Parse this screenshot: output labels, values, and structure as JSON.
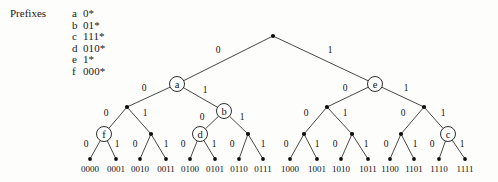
{
  "figure": {
    "type": "binary-trie-diagram",
    "legend": {
      "title": "Prefixes",
      "entries": [
        {
          "key": "a",
          "value": "0*"
        },
        {
          "key": "b",
          "value": "01*"
        },
        {
          "key": "c",
          "value": "111*"
        },
        {
          "key": "d",
          "value": "010*"
        },
        {
          "key": "e",
          "value": "1*"
        },
        {
          "key": "f",
          "value": "000*"
        }
      ]
    },
    "colors": {
      "ink": "#161616",
      "background": "#fdfdfc",
      "node_fill": "#ffffff"
    },
    "edge_labels": {
      "left": "0",
      "right": "1"
    },
    "nodes": [
      {
        "id": "root",
        "label": "",
        "x": 273,
        "y": 36,
        "kind": "dot"
      },
      {
        "id": "n0",
        "label": "a",
        "x": 177,
        "y": 84,
        "kind": "ring"
      },
      {
        "id": "n1",
        "label": "e",
        "x": 375,
        "y": 84,
        "kind": "ring"
      },
      {
        "id": "n00",
        "label": "",
        "x": 127,
        "y": 107,
        "kind": "dot"
      },
      {
        "id": "n01",
        "label": "b",
        "x": 224,
        "y": 111,
        "kind": "ring"
      },
      {
        "id": "n10",
        "label": "",
        "x": 327,
        "y": 107,
        "kind": "dot"
      },
      {
        "id": "n11",
        "label": "",
        "x": 424,
        "y": 107,
        "kind": "dot"
      },
      {
        "id": "n000",
        "label": "f",
        "x": 104,
        "y": 134,
        "kind": "ring"
      },
      {
        "id": "n001",
        "label": "",
        "x": 151,
        "y": 134,
        "kind": "dot"
      },
      {
        "id": "n010",
        "label": "d",
        "x": 200,
        "y": 134,
        "kind": "ring"
      },
      {
        "id": "n011",
        "label": "",
        "x": 248,
        "y": 134,
        "kind": "dot"
      },
      {
        "id": "n100",
        "label": "",
        "x": 304,
        "y": 134,
        "kind": "dot"
      },
      {
        "id": "n101",
        "label": "",
        "x": 352,
        "y": 134,
        "kind": "dot"
      },
      {
        "id": "n110",
        "label": "",
        "x": 401,
        "y": 134,
        "kind": "dot"
      },
      {
        "id": "n111",
        "label": "c",
        "x": 448,
        "y": 134,
        "kind": "ring"
      },
      {
        "id": "L0000",
        "label": "0000",
        "x": 90,
        "y": 159,
        "kind": "leaf"
      },
      {
        "id": "L0001",
        "label": "0001",
        "x": 116,
        "y": 159,
        "kind": "leaf"
      },
      {
        "id": "L0010",
        "label": "0010",
        "x": 140,
        "y": 159,
        "kind": "leaf"
      },
      {
        "id": "L0011",
        "label": "0011",
        "x": 166,
        "y": 159,
        "kind": "leaf"
      },
      {
        "id": "L0100",
        "label": "0100",
        "x": 190,
        "y": 159,
        "kind": "leaf"
      },
      {
        "id": "L0101",
        "label": "0101",
        "x": 215,
        "y": 159,
        "kind": "leaf"
      },
      {
        "id": "L0110",
        "label": "0110",
        "x": 239,
        "y": 159,
        "kind": "leaf"
      },
      {
        "id": "L0111",
        "label": "0111",
        "x": 263,
        "y": 159,
        "kind": "leaf"
      },
      {
        "id": "L1000",
        "label": "1000",
        "x": 290,
        "y": 159,
        "kind": "leaf"
      },
      {
        "id": "L1001",
        "label": "1001",
        "x": 317,
        "y": 159,
        "kind": "leaf"
      },
      {
        "id": "L1010",
        "label": "1010",
        "x": 341,
        "y": 159,
        "kind": "leaf"
      },
      {
        "id": "L1011",
        "label": "1011",
        "x": 368,
        "y": 159,
        "kind": "leaf"
      },
      {
        "id": "L1100",
        "label": "1100",
        "x": 390,
        "y": 159,
        "kind": "leaf"
      },
      {
        "id": "L1101",
        "label": "1101",
        "x": 414,
        "y": 159,
        "kind": "leaf"
      },
      {
        "id": "L1110",
        "label": "1110",
        "x": 439,
        "y": 159,
        "kind": "leaf"
      },
      {
        "id": "L1111",
        "label": "1111",
        "x": 465,
        "y": 159,
        "kind": "leaf"
      }
    ],
    "edges": [
      {
        "from": "root",
        "to": "n0",
        "bit": "0",
        "lx": 218,
        "ly": 53
      },
      {
        "from": "root",
        "to": "n1",
        "bit": "1",
        "lx": 330,
        "ly": 53
      },
      {
        "from": "n0",
        "to": "n00",
        "bit": "0",
        "lx": 144,
        "ly": 91
      },
      {
        "from": "n0",
        "to": "n01",
        "bit": "1",
        "lx": 205,
        "ly": 93
      },
      {
        "from": "n1",
        "to": "n10",
        "bit": "0",
        "lx": 345,
        "ly": 91
      },
      {
        "from": "n1",
        "to": "n11",
        "bit": "1",
        "lx": 406,
        "ly": 91
      },
      {
        "from": "n00",
        "to": "n000",
        "bit": "0",
        "lx": 106,
        "ly": 116
      },
      {
        "from": "n00",
        "to": "n001",
        "bit": "1",
        "lx": 145,
        "ly": 116
      },
      {
        "from": "n01",
        "to": "n010",
        "bit": "0",
        "lx": 202,
        "ly": 120
      },
      {
        "from": "n01",
        "to": "n011",
        "bit": "1",
        "lx": 242,
        "ly": 120
      },
      {
        "from": "n10",
        "to": "n100",
        "bit": "0",
        "lx": 306,
        "ly": 116
      },
      {
        "from": "n10",
        "to": "n101",
        "bit": "1",
        "lx": 345,
        "ly": 116
      },
      {
        "from": "n11",
        "to": "n110",
        "bit": "0",
        "lx": 403,
        "ly": 116
      },
      {
        "from": "n11",
        "to": "n111",
        "bit": "1",
        "lx": 443,
        "ly": 116
      },
      {
        "from": "n000",
        "to": "L0000",
        "bit": "0",
        "lx": 86,
        "ly": 147
      },
      {
        "from": "n000",
        "to": "L0001",
        "bit": "1",
        "lx": 117,
        "ly": 147
      },
      {
        "from": "n001",
        "to": "L0010",
        "bit": "0",
        "lx": 135,
        "ly": 147
      },
      {
        "from": "n001",
        "to": "L0011",
        "bit": "1",
        "lx": 166,
        "ly": 147
      },
      {
        "from": "n010",
        "to": "L0100",
        "bit": "0",
        "lx": 183,
        "ly": 147
      },
      {
        "from": "n010",
        "to": "L0101",
        "bit": "1",
        "lx": 214,
        "ly": 147
      },
      {
        "from": "n011",
        "to": "L0110",
        "bit": "0",
        "lx": 232,
        "ly": 147
      },
      {
        "from": "n011",
        "to": "L0111",
        "bit": "1",
        "lx": 263,
        "ly": 147
      },
      {
        "from": "n100",
        "to": "L1000",
        "bit": "0",
        "lx": 286,
        "ly": 147
      },
      {
        "from": "n100",
        "to": "L1001",
        "bit": "1",
        "lx": 317,
        "ly": 147
      },
      {
        "from": "n101",
        "to": "L1010",
        "bit": "0",
        "lx": 335,
        "ly": 147
      },
      {
        "from": "n101",
        "to": "L1011",
        "bit": "1",
        "lx": 366,
        "ly": 147
      },
      {
        "from": "n110",
        "to": "L1100",
        "bit": "0",
        "lx": 386,
        "ly": 147
      },
      {
        "from": "n110",
        "to": "L1101",
        "bit": "1",
        "lx": 415,
        "ly": 147
      },
      {
        "from": "n111",
        "to": "L1110",
        "bit": "0",
        "lx": 432,
        "ly": 147
      },
      {
        "from": "n111",
        "to": "L1111",
        "bit": "1",
        "lx": 462,
        "ly": 147
      }
    ]
  }
}
